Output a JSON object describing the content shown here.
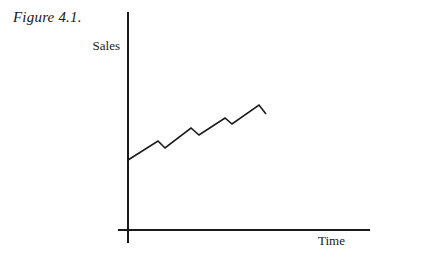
{
  "figure": {
    "caption": "Figure 4.1.",
    "background_color": "#ffffff",
    "ink_color": "#1a1a1a"
  },
  "chart_data": {
    "type": "line",
    "title": "Figure 4.1.",
    "xlabel": "Time",
    "ylabel": "Sales",
    "grid": false,
    "legend": null,
    "axis_ticks": {
      "x": [],
      "y": []
    },
    "axes": {
      "y_axis_top_px": 12,
      "y_axis_bottom_px": 243,
      "y_axis_x_px": 128,
      "x_axis_left_px": 118,
      "x_axis_right_px": 370,
      "x_axis_y_px": 230
    },
    "series": [
      {
        "name": "Sales",
        "points_px": [
          [
            128,
            160
          ],
          [
            158,
            141
          ],
          [
            165,
            148
          ],
          [
            191,
            128
          ],
          [
            199,
            135
          ],
          [
            225,
            118
          ],
          [
            232,
            124
          ],
          [
            259,
            105
          ],
          [
            266,
            114
          ]
        ],
        "values": [
          0,
          19,
          12,
          32,
          25,
          42,
          36,
          55,
          46
        ],
        "line_color": "#1a1a1a",
        "line_width": 1.6
      }
    ]
  }
}
